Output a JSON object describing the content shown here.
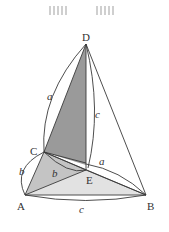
{
  "diagram": {
    "title": "",
    "points": {
      "A": {
        "label": "A",
        "x": 25,
        "y": 195
      },
      "B": {
        "label": "B",
        "x": 146,
        "y": 195
      },
      "C": {
        "label": "C",
        "x": 44,
        "y": 152
      },
      "D": {
        "label": "D",
        "x": 86,
        "y": 44
      },
      "E": {
        "label": "E",
        "x": 86,
        "y": 170
      }
    },
    "edge_labels": {
      "a_left": "a",
      "c_right": "c",
      "b_left": "b",
      "b_inner": "b",
      "a_inner": "a",
      "c_bottom": "c"
    },
    "colors": {
      "dark_shade": "#9a9a9a",
      "mid_shade": "#c4c4c4",
      "light_shade": "#e2e2e2",
      "line": "#3a3a3a",
      "watermark": "#c8c8c8"
    }
  }
}
